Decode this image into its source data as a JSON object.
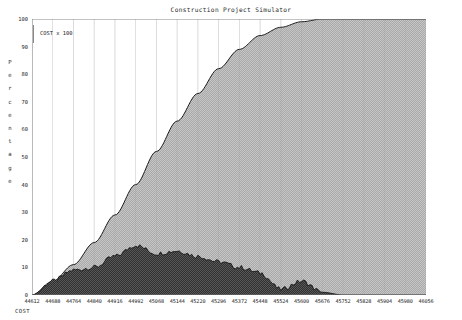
{
  "window": {
    "title": "Construction Project Simulator"
  },
  "axes": {
    "ylabel_text": "Percentage",
    "ylabel_letters": [
      "P",
      "e",
      "r",
      "c",
      "e",
      "n",
      "t",
      "a",
      "g",
      "e"
    ],
    "yticks": [
      0,
      10,
      20,
      30,
      40,
      50,
      60,
      70,
      80,
      90,
      100
    ],
    "ylim": [
      0,
      100
    ],
    "xticks": [
      44612,
      44688,
      44764,
      44840,
      44916,
      44992,
      45068,
      45144,
      45220,
      45296,
      45372,
      45448,
      45524,
      45600,
      45676,
      45752,
      45828,
      45904,
      45980,
      46056
    ],
    "xlim": [
      44612,
      46056
    ],
    "grid": true
  },
  "legend": {
    "entry_label": "COST x  100",
    "position": "top-left-inside"
  },
  "footer": {
    "caption": "COST"
  },
  "colors": {
    "cumulative_fill": "#b8b8b8",
    "cumulative_line": "#1c1c1c",
    "period_fill": "#4a4a4a",
    "period_line": "#141414",
    "axis": "#7a7a7a",
    "grid": "#a8a8a8",
    "text": "#232323",
    "background": "#ffffff"
  },
  "chart_data": {
    "type": "area",
    "title": "Construction Project Simulator",
    "xlabel": "",
    "ylabel": "Percentage",
    "xlim": [
      44612,
      46056
    ],
    "ylim": [
      0,
      100
    ],
    "grid": true,
    "legend": [
      "COST x  100"
    ],
    "x": [
      44612,
      44688,
      44764,
      44840,
      44916,
      44992,
      45068,
      45144,
      45220,
      45296,
      45372,
      45448,
      45524,
      45600,
      45676,
      45752,
      45828,
      45904,
      45980,
      46056
    ],
    "series": [
      {
        "name": "Cumulative cost (S-curve)",
        "type": "area",
        "fill": "#b8b8b8",
        "values": [
          0,
          5,
          11,
          19,
          29,
          40,
          52,
          63,
          73,
          82,
          89,
          94,
          97,
          99,
          100,
          100,
          100,
          100,
          100,
          100
        ]
      },
      {
        "name": "Period cost",
        "type": "area",
        "fill": "#4a4a4a",
        "values": [
          0,
          5,
          9,
          10,
          14,
          18,
          15,
          16,
          14,
          12,
          10,
          8,
          2,
          5,
          1,
          0,
          0,
          0,
          0,
          0
        ]
      }
    ],
    "annotations": []
  }
}
